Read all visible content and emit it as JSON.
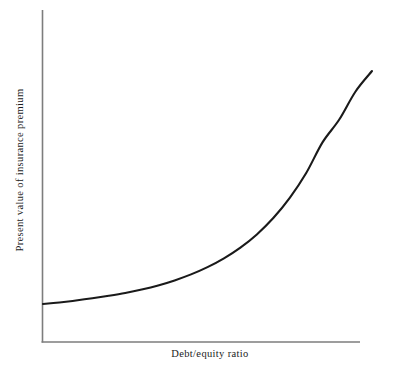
{
  "figure": {
    "background_color": "#ffffff",
    "axis_color": "#7d7d7d",
    "curve_color": "#1a1a1a",
    "text_color": "#1b1b1b"
  },
  "chart_data": {
    "type": "line",
    "title": "",
    "subtitle": "",
    "xlabel": "Debt/equity ratio",
    "ylabel": "Present value of insurance premium",
    "legend": [],
    "annotations": [],
    "grid": false,
    "legend_position": "none",
    "axis_style": "open-left-bottom-spines-no-ticks",
    "tick_labels_x": [],
    "tick_labels_y": [],
    "xlim": [
      0,
      1
    ],
    "ylim": [
      0,
      1
    ],
    "series": [
      {
        "name": "Present value of insurance premium",
        "x": [
          0.0,
          0.05,
          0.1,
          0.15,
          0.2,
          0.25,
          0.3,
          0.35,
          0.4,
          0.45,
          0.5,
          0.55,
          0.6,
          0.65,
          0.7,
          0.75,
          0.8,
          0.85,
          0.9,
          0.95,
          1.0
        ],
        "y": [
          0.115,
          0.12,
          0.126,
          0.133,
          0.141,
          0.15,
          0.161,
          0.174,
          0.19,
          0.209,
          0.232,
          0.26,
          0.294,
          0.336,
          0.388,
          0.452,
          0.531,
          0.629,
          0.7,
          0.79,
          0.855
        ]
      }
    ]
  },
  "geometry": {
    "x_axis_y": 342,
    "y_axis_x": 42.5,
    "y_axis_top": 10,
    "x_axis_right": 360,
    "curve_start": [
      43,
      304
    ],
    "curve_end": [
      372,
      71
    ]
  }
}
